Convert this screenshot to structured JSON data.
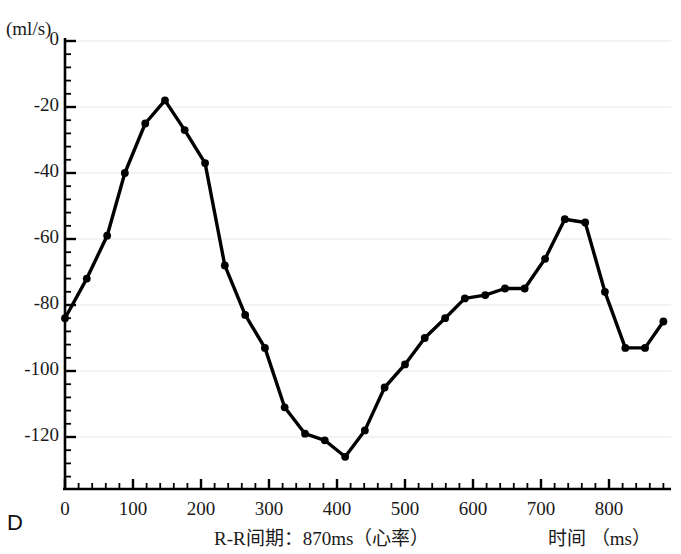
{
  "panel": {
    "letter": "D"
  },
  "axes": {
    "y_unit_label": "(ml/s)",
    "x_title": "R-R间期：870ms（心率）",
    "x_unit_label": "时间 （ms）",
    "y_ticks": [
      0,
      -20,
      -40,
      -60,
      -80,
      -100,
      -120
    ],
    "x_ticks": [
      0,
      100,
      200,
      300,
      400,
      500,
      600,
      700,
      800
    ],
    "axis_color": "#000000",
    "grid_color": "#e8e8e8",
    "line_color": "#000000"
  },
  "chart_data": {
    "type": "line",
    "title": "",
    "xlabel": "R-R间期：870ms（心率）  时间 （ms）",
    "ylabel": "(ml/s)",
    "xlim": [
      0,
      880
    ],
    "ylim": [
      -132,
      2
    ],
    "grid": true,
    "legend": "none",
    "marker": "filled-circle",
    "x_tick_labels": [
      "0",
      "100",
      "200",
      "300",
      "400",
      "500",
      "600",
      "700",
      "800"
    ],
    "y_tick_labels": [
      "0",
      "-20",
      "-40",
      "-60",
      "-80",
      "-100",
      "-120"
    ],
    "minor_ticks_per_major_x": 5,
    "minor_ticks_per_major_y": 5,
    "series": [
      {
        "name": "aortic flow rate",
        "x": [
          0,
          32,
          62,
          88,
          118,
          147,
          176,
          206,
          235,
          265,
          294,
          323,
          353,
          382,
          412,
          441,
          470,
          500,
          529,
          559,
          588,
          618,
          647,
          676,
          706,
          735,
          765,
          794,
          824,
          853,
          880
        ],
        "y": [
          -84,
          -72,
          -59,
          -40,
          -25,
          -18,
          -27,
          -37,
          -68,
          -83,
          -93,
          -111,
          -119,
          -121,
          -126,
          -118,
          -105,
          -98,
          -90,
          -84,
          -78,
          -77,
          -75,
          -75,
          -66,
          -54,
          -55,
          -76,
          -93,
          -93,
          -85
        ]
      }
    ]
  }
}
